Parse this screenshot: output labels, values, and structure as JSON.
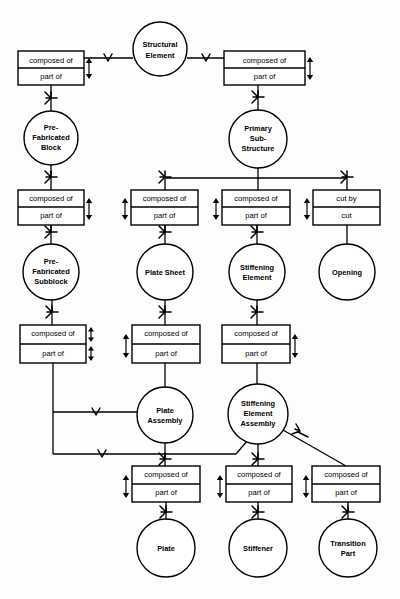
{
  "diagram": {
    "type": "entity-relationship",
    "background_color": "#fdfdfd",
    "line_color": "#000000",
    "labels": {
      "composed_of": "composed of",
      "part_of": "part of",
      "cut_by": "cut by",
      "cut": "cut"
    },
    "entities": [
      {
        "id": "structural-element",
        "lines": [
          "Structural",
          "Element"
        ],
        "cx": 160,
        "cy": 49,
        "r": 27
      },
      {
        "id": "pre-fabricated-block",
        "lines": [
          "Pre-",
          "Fabricated",
          "Block"
        ],
        "cx": 51,
        "cy": 138,
        "r": 27
      },
      {
        "id": "primary-sub-structure",
        "lines": [
          "Primary",
          "Sub-",
          "Structure"
        ],
        "cx": 258,
        "cy": 139,
        "r": 29
      },
      {
        "id": "pre-fabricated-subblock",
        "lines": [
          "Pre-",
          "Fabricated",
          "Subblock"
        ],
        "cx": 51,
        "cy": 272,
        "r": 28
      },
      {
        "id": "plate-sheet",
        "lines": [
          "Plate Sheet"
        ],
        "cx": 165,
        "cy": 272,
        "r": 28
      },
      {
        "id": "stiffening-element",
        "lines": [
          "Stiffening",
          "Element"
        ],
        "cx": 257,
        "cy": 272,
        "r": 28
      },
      {
        "id": "opening",
        "lines": [
          "Opening"
        ],
        "cx": 347,
        "cy": 272,
        "r": 28
      },
      {
        "id": "plate-assembly",
        "lines": [
          "Plate",
          "Assembly"
        ],
        "cx": 165,
        "cy": 415,
        "r": 28
      },
      {
        "id": "stiffening-element-assembly",
        "lines": [
          "Stiffening",
          "Element",
          "Assembly"
        ],
        "cx": 258,
        "cy": 414,
        "r": 30
      },
      {
        "id": "plate",
        "lines": [
          "Plate"
        ],
        "cx": 166,
        "cy": 548,
        "r": 29
      },
      {
        "id": "stiffener",
        "lines": [
          "Stiffener"
        ],
        "cx": 258,
        "cy": 548,
        "r": 29
      },
      {
        "id": "transition-part",
        "lines": [
          "Transition",
          "Part"
        ],
        "cx": 348,
        "cy": 548,
        "r": 29
      }
    ],
    "relationships": [
      {
        "id": "rel-se-pfb",
        "top": "composed of",
        "bottom": "part of",
        "x": 18,
        "y": 51,
        "w": 66,
        "h": 34,
        "marker_side": "right"
      },
      {
        "id": "rel-se-pss",
        "top": "composed of",
        "bottom": "part of",
        "x": 224,
        "y": 51,
        "w": 81,
        "h": 34,
        "marker_side": "right"
      },
      {
        "id": "rel-pfb-pfs",
        "top": "composed of",
        "bottom": "part of",
        "x": 18,
        "y": 190,
        "w": 66,
        "h": 35,
        "marker_side": "right"
      },
      {
        "id": "rel-pss-ps",
        "top": "composed of",
        "bottom": "part of",
        "x": 131,
        "y": 190,
        "w": 67,
        "h": 35,
        "marker_side": "left"
      },
      {
        "id": "rel-pss-sti",
        "top": "composed of",
        "bottom": "part of",
        "x": 222,
        "y": 190,
        "w": 68,
        "h": 35,
        "marker_side": "left"
      },
      {
        "id": "rel-pss-op",
        "top": "cut by",
        "bottom": "cut",
        "x": 313,
        "y": 190,
        "w": 67,
        "h": 35,
        "marker_side": "left"
      },
      {
        "id": "rel-pfs-pa",
        "top": "composed of",
        "bottom": "part of",
        "x": 20,
        "y": 325,
        "w": 66,
        "h": 38,
        "marker_side": "right-double"
      },
      {
        "id": "rel-ps-pa",
        "top": "composed of",
        "bottom": "part of",
        "x": 132,
        "y": 325,
        "w": 68,
        "h": 38,
        "marker_side": "left"
      },
      {
        "id": "rel-sti-sea",
        "top": "composed of",
        "bottom": "part of",
        "x": 222,
        "y": 325,
        "w": 68,
        "h": 38,
        "marker_side": "right"
      },
      {
        "id": "rel-pa-pl",
        "top": "composed of",
        "bottom": "part of",
        "x": 132,
        "y": 466,
        "w": 68,
        "h": 36,
        "marker_side": "left"
      },
      {
        "id": "rel-sea-st",
        "top": "composed of",
        "bottom": "part of",
        "x": 226,
        "y": 466,
        "w": 66,
        "h": 36,
        "marker_side": "left"
      },
      {
        "id": "rel-sea-tp",
        "top": "composed of",
        "bottom": "part of",
        "x": 312,
        "y": 466,
        "w": 68,
        "h": 36,
        "marker_side": "left"
      }
    ]
  }
}
